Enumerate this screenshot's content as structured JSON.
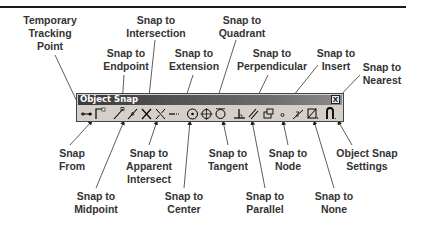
{
  "figure": {
    "labels": {
      "temporary_tracking_point": "Temporary\nTracking\nPoint",
      "snap_from": "Snap\nFrom",
      "snap_to_endpoint": "Snap to\nEndpoint",
      "snap_to_midpoint": "Snap to\nMidpoint",
      "snap_to_intersection": "Snap to\nIntersection",
      "snap_to_apparent_intersect": "Snap to\nApparent\nIntersect",
      "snap_to_extension": "Snap to\nExtension",
      "snap_to_center": "Snap to\nCenter",
      "snap_to_quadrant": "Snap to\nQuadrant",
      "snap_to_tangent": "Snap to\nTangent",
      "snap_to_perpendicular": "Snap to\nPerpendicular",
      "snap_to_parallel": "Snap to\nParallel",
      "snap_to_insert": "Snap to\nInsert",
      "snap_to_node": "Snap to\nNode",
      "snap_to_nearest": "Snap to\nNearest",
      "snap_to_none": "Snap to\nNone",
      "object_snap_settings": "Object Snap\nSettings"
    }
  },
  "toolbar": {
    "title": "Object Snap",
    "close_label": "X",
    "buttons": [
      {
        "name": "temporary-tracking-point",
        "icon": "tracking-icon"
      },
      {
        "name": "snap-from",
        "icon": "from-icon"
      },
      {
        "name": "snap-endpoint",
        "icon": "endpoint-icon"
      },
      {
        "name": "snap-midpoint",
        "icon": "midpoint-icon"
      },
      {
        "name": "snap-intersection",
        "icon": "intersection-icon"
      },
      {
        "name": "snap-apparent-intersect",
        "icon": "apparent-intersect-icon"
      },
      {
        "name": "snap-extension",
        "icon": "extension-icon"
      },
      {
        "name": "snap-center",
        "icon": "center-icon"
      },
      {
        "name": "snap-quadrant",
        "icon": "quadrant-icon"
      },
      {
        "name": "snap-tangent",
        "icon": "tangent-icon"
      },
      {
        "name": "snap-perpendicular",
        "icon": "perpendicular-icon"
      },
      {
        "name": "snap-parallel",
        "icon": "parallel-icon"
      },
      {
        "name": "snap-insert",
        "icon": "insert-icon"
      },
      {
        "name": "snap-node",
        "icon": "node-icon"
      },
      {
        "name": "snap-nearest",
        "icon": "nearest-icon"
      },
      {
        "name": "snap-none",
        "icon": "none-icon"
      },
      {
        "name": "object-snap-settings",
        "icon": "settings-icon"
      }
    ]
  }
}
